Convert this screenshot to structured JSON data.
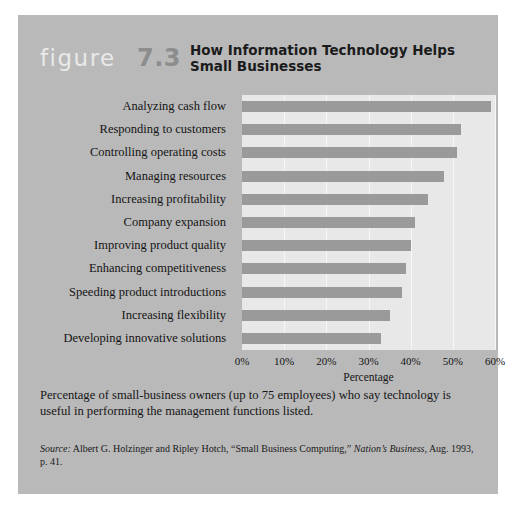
{
  "figure": {
    "word": "figure",
    "number": "7.3",
    "title": "How Information Technology Helps Small Businesses"
  },
  "caption": "Percentage of small-business owners (up to 75 employees) who say technology is useful in performing the management functions listed.",
  "source": {
    "label": "Source:",
    "text": " Albert G. Holzinger and Ripley Hotch, “Small Business Computing,” ",
    "publication": "Nation’s Business",
    "tail": ", Aug. 1993, p. 41."
  },
  "colors": {
    "card_background": "#b9b9b9",
    "plot_background": "#e8e8e8",
    "bar": "#9a9a9a",
    "gridline": "#f7f7f7",
    "figure_word": "#e9e9e9",
    "figure_number": "#8d8d8d"
  },
  "chart_data": {
    "type": "bar",
    "orientation": "horizontal",
    "title": "How Information Technology Helps Small Businesses",
    "xlabel": "Percentage",
    "ylabel": "",
    "xlim": [
      0,
      60
    ],
    "grid": true,
    "legend": false,
    "tick_labels": [
      "0%",
      "10%",
      "20%",
      "30%",
      "40%",
      "50%",
      "60%"
    ],
    "ticks": [
      0,
      10,
      20,
      30,
      40,
      50,
      60
    ],
    "categories": [
      "Analyzing cash flow",
      "Responding to customers",
      "Controlling operating costs",
      "Managing resources",
      "Increasing profitability",
      "Company expansion",
      "Improving product quality",
      "Enhancing competitiveness",
      "Speeding product introductions",
      "Increasing flexibility",
      "Developing innovative solutions"
    ],
    "values": [
      59,
      52,
      51,
      48,
      44,
      41,
      40,
      39,
      38,
      35,
      33
    ]
  }
}
